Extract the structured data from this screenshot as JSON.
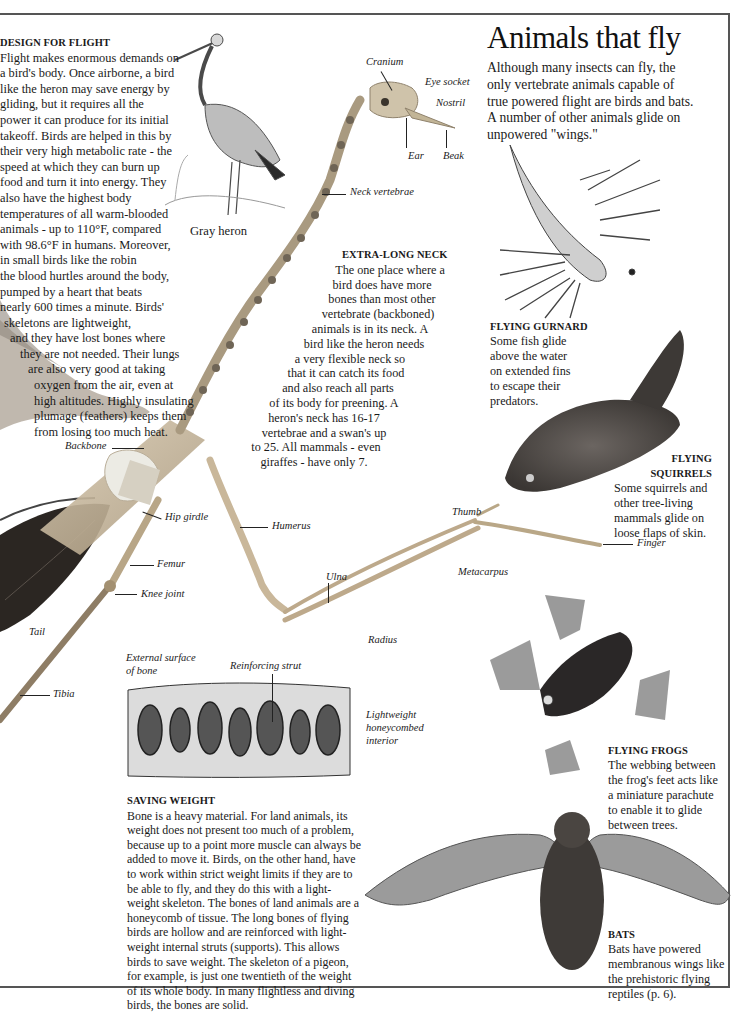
{
  "page": {
    "title": "Animals that fly",
    "intro": "Although many insects can fly, the only vertebrate animals capable of true powered flight are birds and bats. A number of other animals glide on unpowered \"wings.\"",
    "intro_lines": [
      "Although many insects can fly, the",
      "only vertebrate animals capable of",
      "true powered flight are birds and bats.",
      "A number of other animals glide on",
      "unpowered \"wings.\""
    ]
  },
  "design_for_flight": {
    "heading": "DESIGN FOR FLIGHT",
    "lines": [
      "Flight makes enormous demands on",
      "a bird's body. Once airborne, a bird",
      "like the heron may save energy by",
      "gliding, but it requires all the",
      "power it can produce for its initial",
      "takeoff. Birds are helped in this by",
      "their very high metabolic rate - the",
      "speed at which they can burn up",
      "food and turn it into energy. They",
      "also have the highest body",
      "temperatures of all warm-blooded",
      "animals - up to 110°F, compared",
      "with 98.6°F in humans. Moreover,",
      "in small birds like the robin",
      "the blood hurtles around the body,",
      "pumped by a heart that beats",
      "nearly 600 times a minute. Birds'",
      "skeletons are lightweight,",
      "and they have lost bones where",
      "they are not needed. Their lungs",
      "are also very good at taking",
      "oxygen from the air, even at",
      "high altitudes. Highly insulating",
      "plumage (feathers) keeps them",
      "from losing too much heat."
    ],
    "indents": [
      0,
      0,
      0,
      0,
      0,
      0,
      0,
      0,
      0,
      0,
      0,
      0,
      0,
      0,
      0,
      0,
      0,
      4,
      10,
      20,
      28,
      34,
      34,
      34,
      34
    ]
  },
  "heron": {
    "caption": "Gray heron"
  },
  "extra_long_neck": {
    "heading": "EXTRA-LONG NECK",
    "lines": [
      "The one place where a",
      "bird does have more",
      "bones than most other",
      "vertebrate (backboned)",
      "animals is in its neck. A",
      "bird like the heron needs",
      "a very flexible neck so",
      "that it can catch its food",
      "and also reach all parts",
      "of its body for preening. A",
      "heron's neck has 16-17",
      "vertebrae and a swan's up",
      "to 25. All mammals - even",
      "giraffes - have only 7."
    ],
    "offsets": [
      30,
      22,
      22,
      18,
      10,
      4,
      -10,
      -14,
      -22,
      -26,
      -36,
      -36,
      -44,
      -46
    ]
  },
  "skeleton_labels": {
    "cranium": "Cranium",
    "eye_socket": "Eye socket",
    "nostril": "Nostril",
    "ear": "Ear",
    "beak": "Beak",
    "neck_vertebrae": "Neck vertebrae",
    "backbone": "Backbone",
    "hip_girdle": "Hip girdle",
    "humerus": "Humerus",
    "femur": "Femur",
    "knee_joint": "Knee joint",
    "tail": "Tail",
    "tibia": "Tibia",
    "ulna": "Ulna",
    "radius": "Radius",
    "thumb": "Thumb",
    "metacarpus": "Metacarpus",
    "finger": "Finger"
  },
  "bone_section": {
    "external_surface": [
      "External surface",
      "of bone"
    ],
    "reinforcing_strut": "Reinforcing strut",
    "honeycomb": [
      "Lightweight",
      "honeycombed",
      "interior"
    ]
  },
  "saving_weight": {
    "heading": "SAVING WEIGHT",
    "lines": [
      "Bone is a heavy material. For land animals, its",
      "weight does not present too much of a problem,",
      "because up to a point more muscle can always be",
      "added to move it. Birds, on the other hand, have",
      "to work within strict weight limits if they are to",
      "be able to fly, and they do this with a light-",
      "weight skeleton. The bones of land animals are a",
      "honeycomb of tissue. The long bones of flying",
      "birds are hollow and are reinforced with light-",
      "weight internal struts (supports). This allows",
      "birds to save weight. The skeleton of a pigeon,",
      "for example, is just one twentieth of the weight",
      "of its whole body. In many flightless and diving",
      "birds, the bones are solid."
    ]
  },
  "captions": {
    "gurnard": {
      "heading": "FLYING GURNARD",
      "lines": [
        "Some fish glide",
        "above the water",
        "on extended fins",
        "to escape their",
        "predators."
      ]
    },
    "squirrels": {
      "heading_lines": [
        "FLYING",
        "SQUIRRELS"
      ],
      "lines": [
        "Some squirrels and",
        "other tree-living",
        "mammals glide on",
        "loose flaps of skin."
      ]
    },
    "frogs": {
      "heading": "FLYING FROGS",
      "lines": [
        "The webbing between",
        "the frog's feet acts like",
        "a miniature parachute",
        "to enable it to glide",
        "between trees."
      ]
    },
    "bats": {
      "heading": "BATS",
      "lines": [
        "Bats have powered",
        "membranous wings like",
        "the prehistoric flying",
        "reptiles (p. 6)."
      ]
    }
  },
  "colors": {
    "rule": "#555555",
    "text": "#1a1a1a",
    "bone": "#c9b79a",
    "feather": "#2b2622"
  }
}
